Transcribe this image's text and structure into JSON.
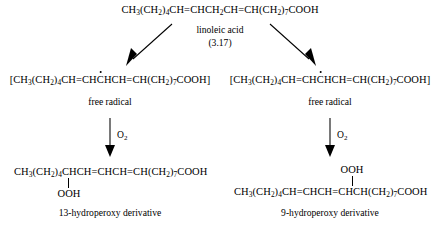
{
  "diagram": {
    "type": "reaction-scheme",
    "ink_color": "#000000",
    "background_color": "#ffffff"
  },
  "reactant": {
    "formula_parts": [
      {
        "t": "CH"
      },
      {
        "sub": "3"
      },
      {
        "t": "(CH"
      },
      {
        "sub": "2"
      },
      {
        "t": ")"
      },
      {
        "sub": "4"
      },
      {
        "t": "CH=CHCH"
      },
      {
        "sub": "2"
      },
      {
        "t": "CH=CH(CH"
      },
      {
        "sub": "2"
      },
      {
        "t": ")"
      },
      {
        "sub": "7"
      },
      {
        "t": "COOH"
      }
    ],
    "formula_plain": "CH3(CH2)4CH=CHCH2CH=CH(CH2)7COOH",
    "name": "linoleic acid",
    "number": "(3.17)"
  },
  "intermediates": {
    "left": {
      "open_bracket": "[",
      "close_bracket": "]",
      "formula_plain": "[CH3(CH2)4CH=CHCHCH=CH(CH2)7COOH]",
      "radical_on": "C of CH following CH=CH",
      "label": "free radical"
    },
    "right": {
      "open_bracket": "[",
      "close_bracket": "]",
      "formula_plain": "[CH3(CH2)4CH=CHCHCH=CH(CH2)7COOH]",
      "radical_on": "C of CH following CH=CH",
      "label": "free radical"
    }
  },
  "reagents": {
    "left_oxygen": "O",
    "left_oxygen_sub": "2",
    "right_oxygen": "O",
    "right_oxygen_sub": "2"
  },
  "products": {
    "left": {
      "formula_plain": "CH3(CH2)4CHCH=CHCH=CH(CH2)7COOH",
      "substituent": "OOH",
      "substituent_position": "below",
      "caption": "13-hydroperoxy derivative"
    },
    "right": {
      "formula_plain": "CH3(CH2)4CH=CHCH=CHCH(CH2)7COOH",
      "substituent": "OOH",
      "substituent_position": "above",
      "caption": "9-hydroperoxy derivative"
    }
  }
}
